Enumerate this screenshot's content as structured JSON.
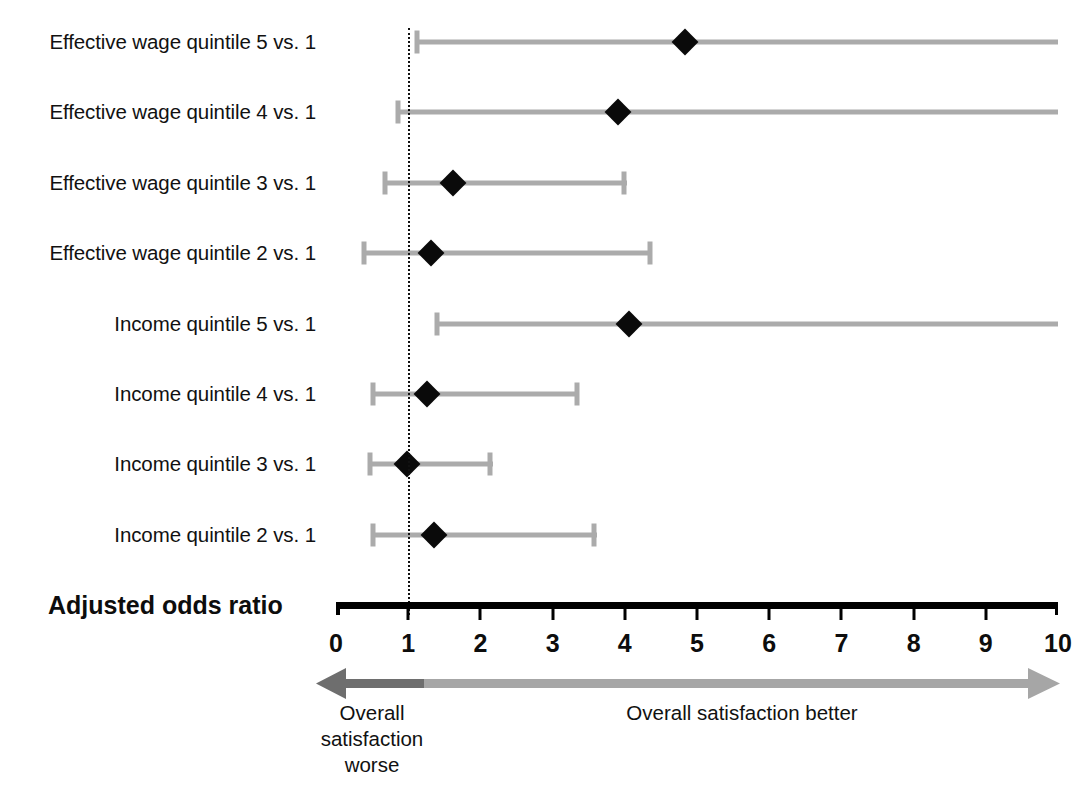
{
  "axis": {
    "title": "Adjusted odds ratio",
    "ticks": [
      "0",
      "1",
      "2",
      "3",
      "4",
      "5",
      "6",
      "7",
      "8",
      "9",
      "10"
    ],
    "min": 0,
    "max": 10,
    "reference_value": 1
  },
  "direction": {
    "left_label": "Overall satisfaction worse",
    "left_label_lines": [
      "Overall",
      "satisfaction",
      "worse"
    ],
    "right_label": "Overall satisfaction better",
    "left_arrow_color": "#6e6e6e",
    "right_arrow_color": "#a6a6a6"
  },
  "colors": {
    "ci_bar": "#ababab",
    "point": "#0a0a0a",
    "axis": "#000000",
    "reference_line": "#111111"
  },
  "chart_data": {
    "type": "scatter",
    "title": "",
    "subtitle": "",
    "xlabel": "Adjusted odds ratio",
    "ylabel": "",
    "xlim": [
      0,
      10
    ],
    "xticks": [
      0,
      1,
      2,
      3,
      4,
      5,
      6,
      7,
      8,
      9,
      10
    ],
    "grid": false,
    "legend": "none",
    "reference_line_x": 1,
    "annotations": [
      "Overall satisfaction worse",
      "Overall satisfaction better"
    ],
    "categories": [
      "Effective wage quintile 5 vs. 1",
      "Effective wage quintile 4 vs. 1",
      "Effective wage quintile 3 vs. 1",
      "Effective wage quintile 2 vs. 1",
      "Income quintile 5 vs. 1",
      "Income quintile 4 vs. 1",
      "Income quintile 3 vs. 1",
      "Income quintile 2 vs. 1"
    ],
    "points": [
      {
        "label": "Effective wage quintile 5 vs. 1",
        "estimate": 4.83,
        "ci_low": 1.09,
        "ci_high": 10.0,
        "ci_high_truncated": true
      },
      {
        "label": "Effective wage quintile 4 vs. 1",
        "estimate": 3.91,
        "ci_low": 0.83,
        "ci_high": 10.0,
        "ci_high_truncated": true
      },
      {
        "label": "Effective wage quintile 3 vs. 1",
        "estimate": 1.62,
        "ci_low": 0.65,
        "ci_high": 4.03,
        "ci_high_truncated": false
      },
      {
        "label": "Effective wage quintile 2 vs. 1",
        "estimate": 1.32,
        "ci_low": 0.36,
        "ci_high": 4.38,
        "ci_high_truncated": false
      },
      {
        "label": "Income quintile 5 vs. 1",
        "estimate": 4.06,
        "ci_low": 1.37,
        "ci_high": 10.0,
        "ci_high_truncated": true
      },
      {
        "label": "Income quintile 4 vs. 1",
        "estimate": 1.26,
        "ci_low": 0.48,
        "ci_high": 3.37,
        "ci_high_truncated": false
      },
      {
        "label": "Income quintile 3 vs. 1",
        "estimate": 0.98,
        "ci_low": 0.44,
        "ci_high": 2.17,
        "ci_high_truncated": false
      },
      {
        "label": "Income quintile 2 vs. 1",
        "estimate": 1.36,
        "ci_low": 0.48,
        "ci_high": 3.61,
        "ci_high_truncated": false
      }
    ]
  }
}
